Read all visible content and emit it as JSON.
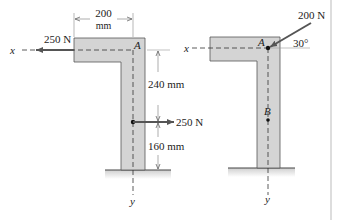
{
  "colors": {
    "member_fill": "#d4d4d4",
    "member_stroke": "#555555",
    "line": "#333333",
    "arrow": "#555555",
    "ground": "#cfcfcf",
    "border": "#bbbbbb"
  },
  "left_figure": {
    "axis_x_label": "x",
    "axis_y_label": "y",
    "point_A_label": "A",
    "width_dim_value": "200",
    "width_dim_unit": "mm",
    "top_force_label": "250 N",
    "mid_force_label": "250 N",
    "upper_dim_label": "240 mm",
    "lower_dim_label": "160 mm"
  },
  "right_figure": {
    "axis_x_label": "x",
    "axis_y_label": "y",
    "point_A_label": "A",
    "point_B_label": "B",
    "force_label": "200 N",
    "angle_label": "30°"
  }
}
